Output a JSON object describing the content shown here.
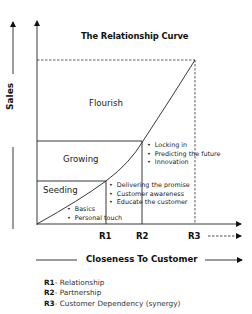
{
  "title": "The Relationship Curve",
  "y_axis_label": "Sales",
  "x_axis_label": "Closeness To Customer",
  "regions": [
    {
      "name": "Flourish",
      "bullets": [
        "Locking in",
        "Predicting the future",
        "Innovation"
      ]
    },
    {
      "name": "Growing",
      "bullets": [
        "Delivering the promise",
        "Customer awareness",
        "Educate the customer"
      ]
    },
    {
      "name": "Seeding",
      "bullets": [
        "Basics",
        "Personal touch"
      ]
    }
  ],
  "x_markers": [
    "R1",
    "R2",
    "R3"
  ],
  "legend": [
    {
      "key": "R1",
      "sep": "- ",
      "text": "Relationship"
    },
    {
      "key": "R2",
      "sep": "- ",
      "text": "Partnership"
    },
    {
      "key": "R3",
      "sep": "- ",
      "text": "Customer Dependency (synergy)"
    }
  ]
}
